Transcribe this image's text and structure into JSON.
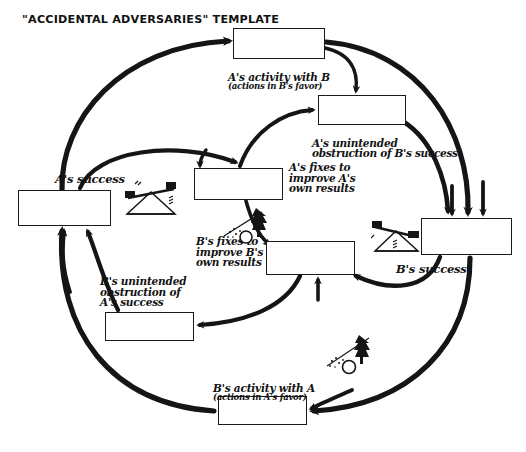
{
  "title": "\"ACCIDENTAL ADVERSARIES\" TEMPLATE",
  "diagram": {
    "type": "causal-loop-diagram",
    "archetype": "Accidental Adversaries",
    "style": "hand-drawn",
    "colors": {
      "ink": "#1a1a1a",
      "paper": "#ffffff"
    },
    "nodes": [
      {
        "id": "a-activity",
        "label": "A's activity with B",
        "sublabel": "(actions in B's favor)",
        "box": {
          "x": 233,
          "y": 28,
          "w": 92,
          "h": 31
        },
        "label_pos": {
          "x": 228,
          "y": 61
        }
      },
      {
        "id": "a-obstruction",
        "label": "A's unintended",
        "sublabel": "obstruction of B's success",
        "box": {
          "x": 318,
          "y": 95,
          "w": 88,
          "h": 30
        },
        "label_pos": {
          "x": 312,
          "y": 127
        }
      },
      {
        "id": "a-fixes",
        "label": "A's fixes to\nimprove A's\nown results",
        "sublabel": "",
        "box": {
          "x": 194,
          "y": 168,
          "w": 89,
          "h": 32
        },
        "label_pos": {
          "x": 289,
          "y": 162
        }
      },
      {
        "id": "a-success",
        "label": "A's success",
        "sublabel": "",
        "box": {
          "x": 18,
          "y": 190,
          "w": 93,
          "h": 36
        },
        "label_pos": {
          "x": 55,
          "y": 174
        }
      },
      {
        "id": "b-fixes",
        "label": "B's fixes to\nimprove B's\nown results",
        "sublabel": "",
        "box": {
          "x": 266,
          "y": 241,
          "w": 89,
          "h": 34
        },
        "label_pos": {
          "x": 196,
          "y": 236
        }
      },
      {
        "id": "b-success",
        "label": "B's success",
        "sublabel": "",
        "box": {
          "x": 421,
          "y": 218,
          "w": 91,
          "h": 37
        },
        "label_pos": {
          "x": 396,
          "y": 264
        }
      },
      {
        "id": "b-obstruction",
        "label": "B's unintended\nobstruction of\nA's success",
        "sublabel": "",
        "box": {
          "x": 105,
          "y": 312,
          "w": 89,
          "h": 29
        },
        "label_pos": {
          "x": 100,
          "y": 276
        }
      },
      {
        "id": "b-activity",
        "label": "B's activity with A",
        "sublabel": "(actions in A's favor)",
        "box": {
          "x": 218,
          "y": 396,
          "w": 89,
          "h": 29
        },
        "label_pos": {
          "x": 213,
          "y": 372
        }
      }
    ],
    "icons": [
      {
        "id": "seesaw-left",
        "name": "seesaw-balance-icon",
        "x": 122,
        "y": 178,
        "tilt": "left-down"
      },
      {
        "id": "seesaw-right",
        "name": "seesaw-balance-icon",
        "x": 371,
        "y": 218,
        "tilt": "right-down"
      },
      {
        "id": "snowball-upper",
        "name": "snowball-rolling-icon",
        "x": 222,
        "y": 206
      },
      {
        "id": "snowball-lower",
        "name": "snowball-rolling-icon",
        "x": 325,
        "y": 334
      }
    ],
    "links": [
      {
        "from": "a-success",
        "to": "a-activity",
        "kind": "reinforcing-outer"
      },
      {
        "from": "a-activity",
        "to": "b-success",
        "kind": "reinforcing-outer"
      },
      {
        "from": "b-success",
        "to": "b-activity",
        "kind": "reinforcing-outer"
      },
      {
        "from": "b-activity",
        "to": "a-success",
        "kind": "reinforcing-outer"
      },
      {
        "from": "a-activity",
        "to": "a-obstruction",
        "kind": "balancing"
      },
      {
        "from": "a-obstruction",
        "to": "b-success",
        "kind": "balancing"
      },
      {
        "from": "a-success",
        "to": "a-fixes",
        "kind": "balancing"
      },
      {
        "from": "a-fixes",
        "to": "a-obstruction",
        "kind": "balancing"
      },
      {
        "from": "b-success",
        "to": "b-fixes",
        "kind": "balancing"
      },
      {
        "from": "b-fixes",
        "to": "b-obstruction",
        "kind": "balancing"
      },
      {
        "from": "b-obstruction",
        "to": "a-success",
        "kind": "balancing"
      },
      {
        "from": "a-fixes",
        "to": "b-fixes",
        "kind": "balancing"
      }
    ]
  }
}
